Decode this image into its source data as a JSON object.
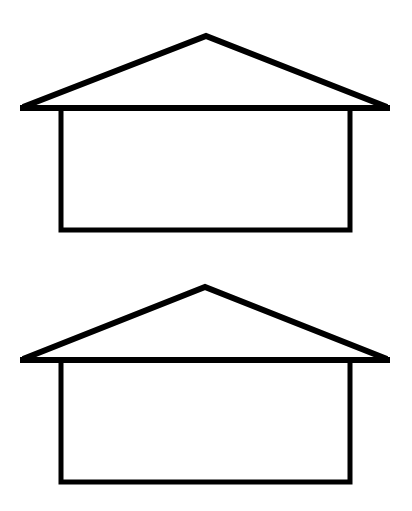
{
  "figure": {
    "stroke_color": "#000000",
    "background": "#ffffff",
    "houses": [
      {
        "roof": {
          "apex": [
            206,
            35
          ],
          "left": [
            21,
            108
          ],
          "right": [
            389,
            108
          ]
        },
        "body": {
          "x": 61,
          "y": 108,
          "w": 289,
          "h": 122
        }
      },
      {
        "roof": {
          "apex": [
            205,
            287
          ],
          "left": [
            21,
            360
          ],
          "right": [
            389,
            360
          ]
        },
        "body": {
          "x": 61,
          "y": 360,
          "w": 289,
          "h": 122
        }
      }
    ]
  }
}
